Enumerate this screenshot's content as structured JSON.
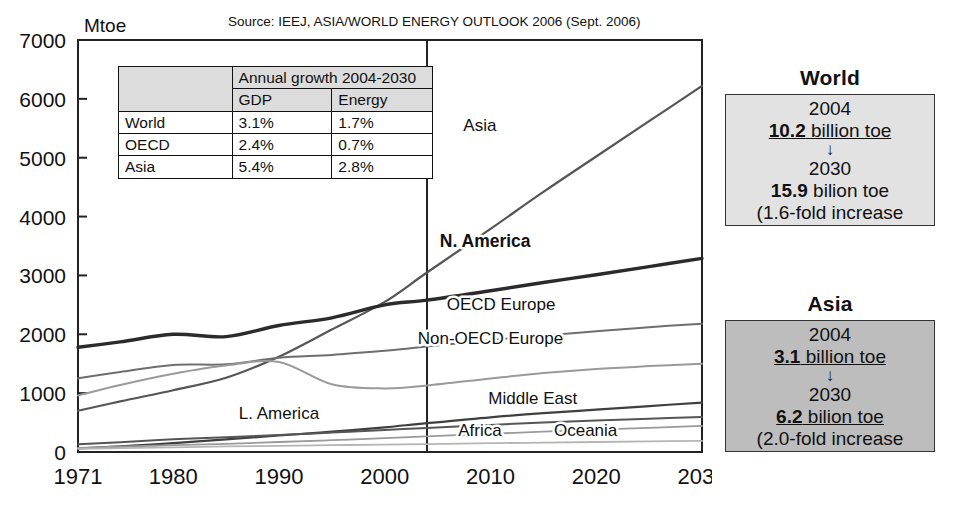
{
  "source_note": "Source: IEEJ, ASIA/WORLD ENERGY OUTLOOK 2006 (Sept. 2006)",
  "growth_table": {
    "corner": "",
    "span_header": "Annual growth 2004-2030",
    "columns": [
      "GDP",
      "Energy"
    ],
    "rows": [
      {
        "label": "World",
        "gdp": "3.1%",
        "energy": "1.7%",
        "muted": false
      },
      {
        "label": "OECD",
        "gdp": "2.4%",
        "energy": "0.7%",
        "muted": false
      },
      {
        "label": "Asia",
        "gdp": "5.4%",
        "energy": "2.8%",
        "muted": true
      }
    ]
  },
  "panels": [
    {
      "title": "World",
      "year_from": "2004",
      "value_from_num": "10.2",
      "value_from_unit": " billion toe",
      "arrow": "↓",
      "year_to": "2030",
      "value_to_num": "15.9",
      "value_to_unit": " bilion toe",
      "footnote": "(1.6-fold increase",
      "fill": "#e2e2e2"
    },
    {
      "title": "Asia",
      "year_from": "2004",
      "value_from_num": "3.1",
      "value_from_unit": " billion toe",
      "arrow": "↓",
      "year_to": "2030",
      "value_to_num": "6.2",
      "value_to_unit": " bilion toe",
      "footnote": "(2.0-fold increase",
      "fill": "#bdbdbd"
    }
  ],
  "chart_data": {
    "type": "line",
    "title": "",
    "xlabel": "",
    "ylabel": "Mtoe",
    "xlim": [
      1971,
      2030
    ],
    "ylim": [
      0,
      7000
    ],
    "xticks": [
      1971,
      1980,
      1990,
      2000,
      2010,
      2020,
      2030
    ],
    "yticks": [
      0,
      1000,
      2000,
      3000,
      4000,
      5000,
      6000,
      7000
    ],
    "grid": false,
    "legend": "inline-labels",
    "forecast_divider_x": 2004,
    "x": [
      1971,
      1975,
      1980,
      1985,
      1990,
      1995,
      2000,
      2004,
      2010,
      2015,
      2020,
      2025,
      2030
    ],
    "series": [
      {
        "name": "Asia",
        "label": "Asia",
        "color": "#555555",
        "width": 2.2,
        "bold_label": false,
        "label_x": 2009,
        "label_y": 5450,
        "values": [
          700,
          860,
          1050,
          1260,
          1620,
          2080,
          2550,
          3050,
          3790,
          4420,
          5020,
          5620,
          6220
        ]
      },
      {
        "name": "N. America",
        "label": "N. America",
        "color": "#2b2b2b",
        "width": 3.4,
        "bold_label": true,
        "label_x": 2009.5,
        "label_y": 3480,
        "values": [
          1780,
          1870,
          2000,
          1960,
          2150,
          2280,
          2500,
          2580,
          2740,
          2880,
          3010,
          3150,
          3290
        ]
      },
      {
        "name": "OECD Europe",
        "label": "OECD Europe",
        "color": "#6e6e6e",
        "width": 2.0,
        "bold_label": false,
        "label_x": 2011,
        "label_y": 2420,
        "values": [
          1250,
          1360,
          1480,
          1490,
          1600,
          1650,
          1720,
          1790,
          1900,
          1980,
          2050,
          2120,
          2180
        ]
      },
      {
        "name": "Non-OECD Europe",
        "label": "Non-OECD Europe",
        "color": "#9a9a9a",
        "width": 2.0,
        "bold_label": false,
        "label_x": 2010,
        "label_y": 1830,
        "values": [
          960,
          1140,
          1330,
          1470,
          1530,
          1150,
          1080,
          1130,
          1250,
          1340,
          1410,
          1460,
          1500
        ]
      },
      {
        "name": "Middle East",
        "label": "Middle East",
        "color": "#3f3f3f",
        "width": 2.2,
        "bold_label": false,
        "label_x": 2014,
        "label_y": 810,
        "values": [
          60,
          95,
          150,
          215,
          280,
          345,
          420,
          490,
          590,
          660,
          720,
          780,
          840
        ]
      },
      {
        "name": "L. America",
        "label": "L. America",
        "color": "#555555",
        "width": 2.0,
        "bold_label": false,
        "label_x": 1990,
        "label_y": 560,
        "values": [
          130,
          165,
          215,
          250,
          290,
          330,
          375,
          410,
          460,
          500,
          535,
          565,
          595
        ]
      },
      {
        "name": "Africa",
        "label": "Africa",
        "color": "#9a9a9a",
        "width": 1.8,
        "bold_label": false,
        "label_x": 2009,
        "label_y": 270,
        "values": [
          70,
          90,
          115,
          140,
          170,
          200,
          235,
          265,
          310,
          345,
          380,
          410,
          445
        ]
      },
      {
        "name": "Oceania",
        "label": "Oceania",
        "color": "#b5b5b5",
        "width": 1.8,
        "bold_label": false,
        "label_x": 2019,
        "label_y": 270,
        "values": [
          55,
          65,
          80,
          95,
          105,
          115,
          125,
          135,
          150,
          160,
          170,
          180,
          190
        ]
      }
    ]
  }
}
